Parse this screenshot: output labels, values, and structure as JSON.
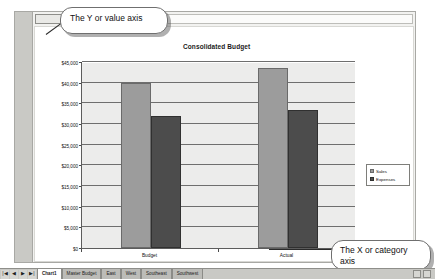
{
  "window": {
    "name_box_value": "",
    "name_box_dropdown_icon": "dropdown-arrow-icon"
  },
  "chart": {
    "title": "Consolidated Budget"
  },
  "callouts": {
    "y_axis": "The Y or value axis",
    "x_axis": "The X or category axis"
  },
  "legend": {
    "items": [
      {
        "label": "Sales",
        "color": "#9c9c9c"
      },
      {
        "label": "Expenses",
        "color": "#4c4c4c"
      }
    ]
  },
  "tab_bar": {
    "nav_buttons": [
      "|◀",
      "◀",
      "▶",
      "▶|"
    ],
    "tabs": [
      {
        "label": "Chart1",
        "active": true
      },
      {
        "label": "Master Budget",
        "active": false
      },
      {
        "label": "East",
        "active": false
      },
      {
        "label": "West",
        "active": false
      },
      {
        "label": "Southeast",
        "active": false
      },
      {
        "label": "Southwest",
        "active": false
      }
    ],
    "status_text": "Ready"
  },
  "chart_data": {
    "type": "bar",
    "title": "Consolidated Budget",
    "xlabel": "",
    "ylabel": "",
    "categories": [
      "Budget",
      "Actual"
    ],
    "series": [
      {
        "name": "Sales",
        "color": "#9c9c9c",
        "values": [
          40000,
          43500
        ]
      },
      {
        "name": "Expenses",
        "color": "#4c4c4c",
        "values": [
          32000,
          33500
        ]
      }
    ],
    "ylim": [
      0,
      45000
    ],
    "ytick_step": 5000,
    "ytick_labels": [
      "$0",
      "$5,000",
      "$10,000",
      "$15,000",
      "$20,000",
      "$25,000",
      "$30,000",
      "$35,000",
      "$40,000",
      "$45,000"
    ],
    "grid": true,
    "legend_position": "right"
  }
}
